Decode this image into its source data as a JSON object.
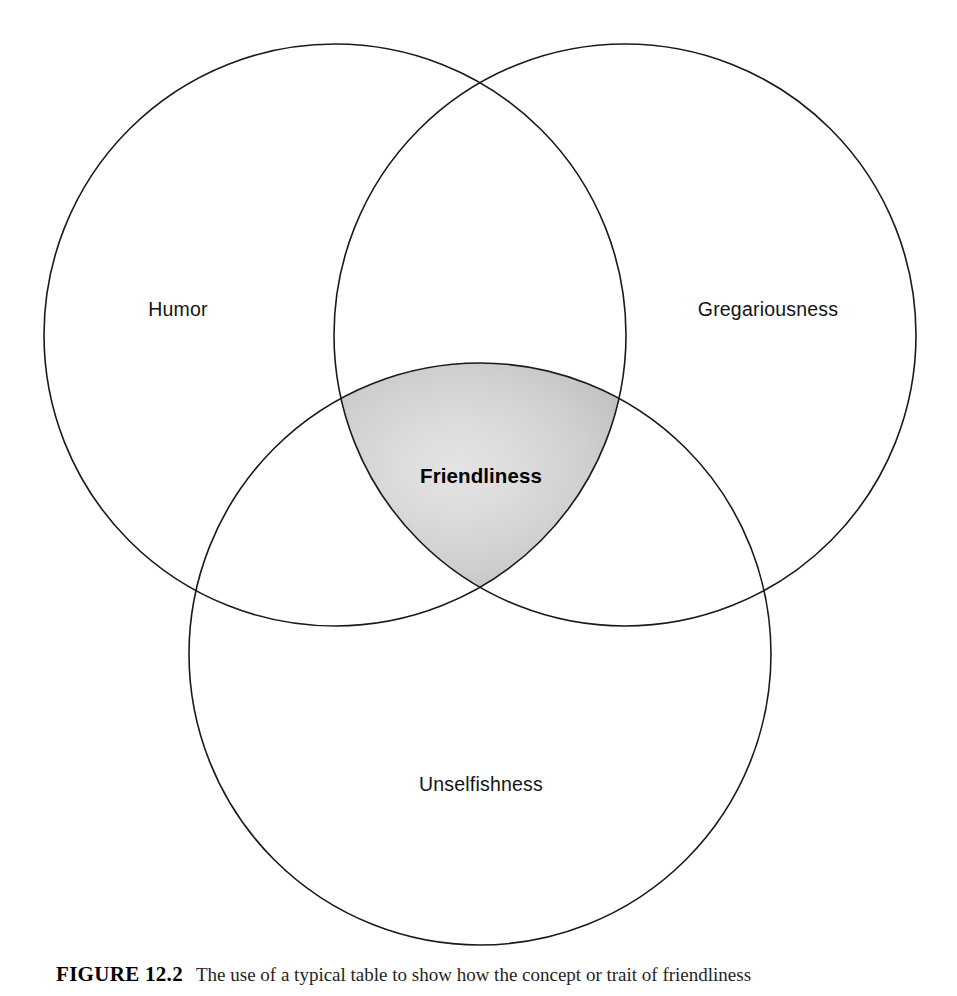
{
  "figure": {
    "type": "venn-diagram",
    "set_count": 3,
    "background_color": "#ffffff",
    "stroke_color": "#1a1a1a"
  },
  "chart_data": {
    "type": "venn",
    "title": "",
    "sets": [
      {
        "id": "humor",
        "label": "Humor",
        "position": "top-left"
      },
      {
        "id": "gregariousness",
        "label": "Gregariousness",
        "position": "top-right"
      },
      {
        "id": "unselfishness",
        "label": "Unselfishness",
        "position": "bottom"
      }
    ],
    "intersections": [
      {
        "id": "all-three",
        "label": "Friendliness",
        "members": [
          "humor",
          "gregariousness",
          "unselfishness"
        ],
        "shaded": true,
        "fill": "radial-gradient light-center to dark-edge",
        "fill_center_color": "#dcdcdc",
        "fill_edge_color": "#4a4a4a"
      }
    ],
    "legend": "none",
    "grid": false
  },
  "circles": {
    "humor": {
      "cx": 335,
      "cy": 335,
      "r": 291
    },
    "gregariousness": {
      "cx": 625,
      "cy": 335,
      "r": 291
    },
    "unselfishness": {
      "cx": 480,
      "cy": 654,
      "r": 291
    }
  },
  "labels": {
    "humor": {
      "text": "Humor",
      "x": 178,
      "y": 311
    },
    "gregariousness": {
      "text": "Gregariousness",
      "x": 768,
      "y": 311
    },
    "unselfishness": {
      "text": "Unselfishness",
      "x": 481,
      "y": 786
    },
    "friendliness": {
      "text": "Friendliness",
      "x": 481,
      "y": 478
    }
  },
  "caption": {
    "label": "FIGURE 12.2",
    "text": "The use of a typical table to show how the concept or trait of friendliness"
  }
}
